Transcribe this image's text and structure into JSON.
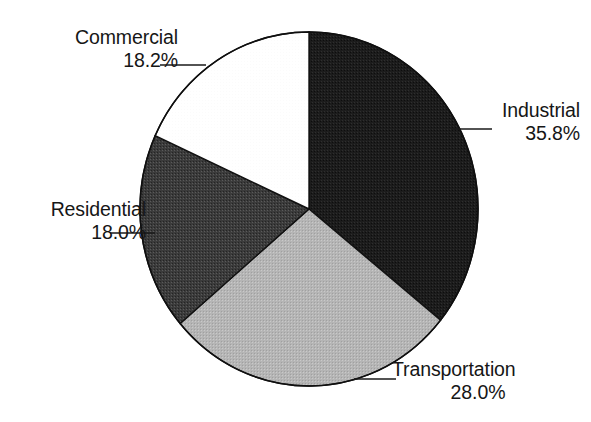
{
  "figure": {
    "type": "pie-chart",
    "background_color": "#ffffff",
    "has_title": false,
    "has_legend": false,
    "label_style": "callout-with-leader-line"
  },
  "chart_data": {
    "type": "pie",
    "title": "",
    "xlabel": "",
    "ylabel": "",
    "units": "percent",
    "start_angle_deg": 0,
    "direction": "clockwise",
    "categories": [
      "Industrial",
      "Transportation",
      "Residential",
      "Commercial"
    ],
    "values": [
      35.8,
      28.0,
      18.0,
      18.2
    ],
    "value_labels": [
      "35.8%",
      "28.0%",
      "18.0%",
      "18.2%"
    ],
    "colors": [
      "#1c1c1c",
      "#b3b3b3",
      "#3b3b3b",
      "#ffffff"
    ],
    "legend_position": "none",
    "grid": false,
    "slices": [
      {
        "name": "Industrial",
        "value": 35.8,
        "value_label": "35.8%",
        "color": "#1c1c1c",
        "start_deg": 0.0,
        "end_deg": 128.88,
        "label_position": "right"
      },
      {
        "name": "Transportation",
        "value": 28.0,
        "value_label": "28.0%",
        "color": "#b3b3b3",
        "start_deg": 128.88,
        "end_deg": 229.68,
        "label_position": "bottom-right"
      },
      {
        "name": "Residential",
        "value": 18.0,
        "value_label": "18.0%",
        "color": "#3b3b3b",
        "start_deg": 229.68,
        "end_deg": 294.48,
        "label_position": "left"
      },
      {
        "name": "Commercial",
        "value": 18.2,
        "value_label": "18.2%",
        "color": "#ffffff",
        "start_deg": 294.48,
        "end_deg": 360.0,
        "label_position": "top-left"
      }
    ]
  },
  "labels": {
    "commercial": {
      "name": "Commercial",
      "value": "18.2%"
    },
    "industrial": {
      "name": "Industrial",
      "value": "35.8%"
    },
    "residential": {
      "name": "Residential",
      "value": "18.0%"
    },
    "transportation": {
      "name": "Transportation",
      "value": "28.0%"
    }
  }
}
